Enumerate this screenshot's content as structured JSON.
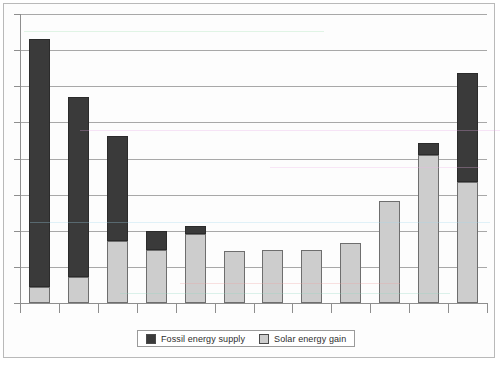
{
  "chart_data": {
    "type": "bar",
    "stacked": true,
    "title": "",
    "subtitle": "",
    "xlabel": "",
    "ylabel": "",
    "grid": true,
    "legend_position": "bottom",
    "ylim": [
      0,
      8
    ],
    "y_gridline_values": [
      1,
      2,
      3,
      4,
      5,
      6,
      7,
      8
    ],
    "x_tick_labels": [
      "",
      "",
      "",
      "",
      "",
      "",
      "",
      "",
      "",
      "",
      "",
      ""
    ],
    "categories": [
      "1",
      "2",
      "3",
      "4",
      "5",
      "6",
      "7",
      "8",
      "9",
      "10",
      "11",
      "12"
    ],
    "series": [
      {
        "name": "Solar energy gain",
        "color": "#cdcdcd",
        "values": [
          0.44,
          0.72,
          1.72,
          1.47,
          1.92,
          1.44,
          1.47,
          1.47,
          1.67,
          2.83,
          4.11,
          3.36
        ]
      },
      {
        "name": "Fossil energy supply",
        "color": "#3a3a3a",
        "values": [
          6.86,
          4.97,
          2.89,
          0.53,
          0.22,
          0.0,
          0.0,
          0.0,
          0.0,
          0.0,
          0.31,
          3.0
        ]
      }
    ],
    "totals": [
      7.3,
      5.69,
      4.61,
      2.0,
      2.14,
      1.44,
      1.47,
      1.47,
      1.67,
      2.83,
      4.42,
      6.36
    ]
  },
  "legend": {
    "entries": [
      {
        "label": "Fossil energy supply",
        "swatch": "dark-swatch-icon",
        "color": "#3a3a3a"
      },
      {
        "label": "Solar energy gain",
        "swatch": "light-swatch-icon",
        "color": "#cdcdcd"
      }
    ]
  },
  "colors": {
    "fossil": "#3a3a3a",
    "solar": "#cdcdcd",
    "gridline": "#a8a8a8",
    "axis": "#8e8e8e",
    "page_border": "#b9b9b9",
    "background": "#ffffff"
  }
}
